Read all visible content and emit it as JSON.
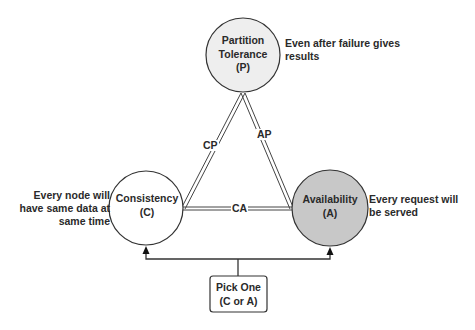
{
  "diagram": {
    "nodes": {
      "partition": {
        "line1": "Partition",
        "line2": "Tolerance",
        "line3": "(P)",
        "fill": "#eeeeee",
        "description_line1": "Even after failure gives",
        "description_line2": "results"
      },
      "consistency": {
        "line1": "Consistency",
        "line2": "(C)",
        "fill": "#ffffff",
        "description_line1": "Every node will",
        "description_line2": "have same data at",
        "description_line3": "same time"
      },
      "availability": {
        "line1": "Availability",
        "line2": "(A)",
        "fill": "#c8c8c8",
        "description_line1": "Every request will",
        "description_line2": "be served"
      }
    },
    "edges": {
      "cp": "CP",
      "ap": "AP",
      "ca": "CA"
    },
    "choice_box": {
      "line1": "Pick One",
      "line2": "(C or A)"
    },
    "colors": {
      "stroke": "#333333",
      "background": "#ffffff"
    }
  }
}
